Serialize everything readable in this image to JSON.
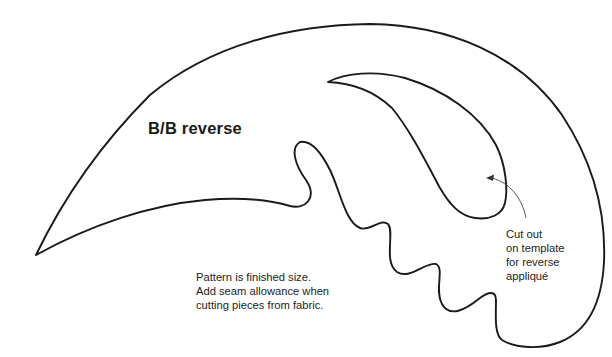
{
  "title": "B/B reverse",
  "notes": {
    "lines": [
      "Pattern is finished size.",
      "Add seam allowance when",
      "cutting pieces from fabric."
    ]
  },
  "callout": {
    "lines": [
      "Cut out",
      "on template",
      "for reverse",
      "appliqué"
    ]
  },
  "colors": {
    "line": "#1a1a1a",
    "background": "#ffffff"
  }
}
